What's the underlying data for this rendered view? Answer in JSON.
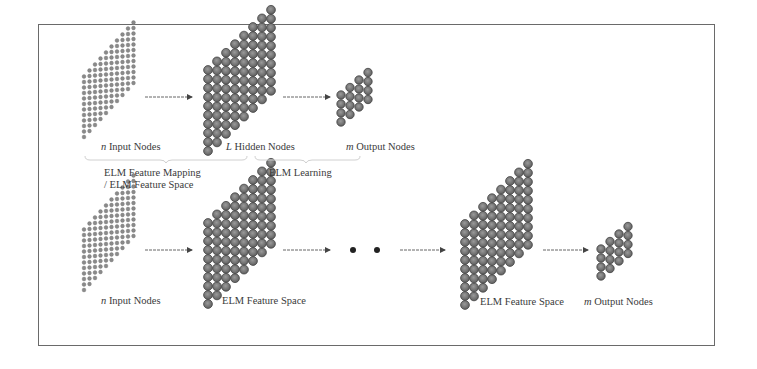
{
  "figure": {
    "top_row": {
      "input_label_var": "n",
      "input_label": "Input Nodes",
      "hidden_label_var": "L",
      "hidden_label": "Hidden Nodes",
      "output_label_var": "m",
      "output_label": "Output Nodes",
      "brace_left_label_line1": "ELM Feature Mapping",
      "brace_left_label_line2": "/ ELM Feature Space",
      "brace_right_label": "ELM Learning"
    },
    "bottom_row": {
      "input_label_var": "n",
      "input_label": "Input Nodes",
      "feature1_label": "ELM Feature Space",
      "ellipsis": "• •",
      "feature2_label": "ELM Feature Space",
      "output_label_var": "m",
      "output_label": "Output Nodes"
    },
    "colors": {
      "frame": "#6a6a6a",
      "node_fill": "#7a7a7a",
      "node_stroke": "#4a4a4a",
      "arrow": "#555555",
      "brace": "#d0d0d0"
    }
  }
}
